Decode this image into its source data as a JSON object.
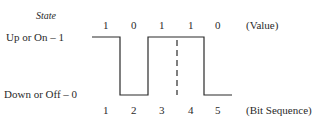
{
  "diagram": {
    "state_label": "State",
    "levels": {
      "high": "Up or On – 1",
      "low": "Down or Off – 0"
    },
    "values": [
      "1",
      "0",
      "1",
      "1",
      "0"
    ],
    "values_label": "(Value)",
    "bit_sequence": [
      "1",
      "2",
      "3",
      "4",
      "5"
    ],
    "bit_sequence_label": "(Bit Sequence)",
    "line_color": "#2a2a2a"
  }
}
